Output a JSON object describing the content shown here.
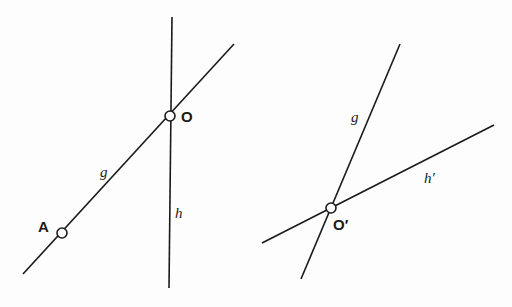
{
  "figure": {
    "left": {
      "lines": {
        "g": {
          "x1": 23,
          "y1": 274,
          "x2": 234,
          "y2": 44,
          "label": "g",
          "label_x": 100,
          "label_y": 177
        },
        "h": {
          "x1": 172,
          "y1": 17,
          "x2": 169,
          "y2": 288,
          "label": "h",
          "label_x": 175,
          "label_y": 218
        }
      },
      "points": {
        "O": {
          "cx": 170,
          "cy": 116,
          "label": "O",
          "label_x": 181,
          "label_y": 122
        },
        "A": {
          "cx": 62,
          "cy": 233,
          "label": "A",
          "label_x": 38,
          "label_y": 232
        }
      }
    },
    "right": {
      "lines": {
        "g": {
          "x1": 400,
          "y1": 44,
          "x2": 301,
          "y2": 279,
          "label": "g",
          "label_x": 351,
          "label_y": 122
        },
        "h_prime": {
          "x1": 262,
          "y1": 243,
          "x2": 494,
          "y2": 125,
          "label": "h′",
          "label_x": 424,
          "label_y": 183
        }
      },
      "points": {
        "O_prime": {
          "cx": 331,
          "cy": 208,
          "label": "O′",
          "label_x": 333,
          "label_y": 230
        }
      }
    },
    "colors": {
      "ink": "#1a1a1a",
      "paper": "#fdfdfd"
    }
  }
}
